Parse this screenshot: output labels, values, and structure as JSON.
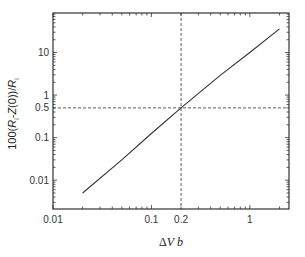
{
  "chart_data": {
    "type": "line",
    "title": "",
    "xlabel": "ΔV b",
    "ylabel": "100(R_i - Z(0))/R_i",
    "xscale": "log",
    "yscale": "log",
    "xlim": [
      0.01,
      2.5
    ],
    "ylim": [
      0.0021,
      85
    ],
    "grid": false,
    "legend": null,
    "x_ticks": [
      {
        "value": 0.01,
        "label": "0.01"
      },
      {
        "value": 0.1,
        "label": "0.1"
      },
      {
        "value": 0.2,
        "label": "0.2"
      },
      {
        "value": 1,
        "label": "1"
      }
    ],
    "y_ticks": [
      {
        "value": 0.01,
        "label": "0.01"
      },
      {
        "value": 0.1,
        "label": "0.1"
      },
      {
        "value": 0.5,
        "label": "0.5"
      },
      {
        "value": 1,
        "label": "1"
      },
      {
        "value": 10,
        "label": "10"
      }
    ],
    "series": [
      {
        "name": "curve",
        "style": "solid",
        "color": "#333333",
        "x": [
          0.02,
          0.05,
          0.1,
          0.2,
          0.5,
          1.0,
          2.0
        ],
        "y": [
          0.005,
          0.03,
          0.125,
          0.5,
          2.9,
          10,
          36
        ]
      }
    ],
    "annotations": [
      {
        "type": "vline",
        "x": 0.2,
        "style": "dashed"
      },
      {
        "type": "hline",
        "y": 0.5,
        "style": "dashed"
      }
    ]
  },
  "labels": {
    "x_title_delta": "Δ",
    "x_title_V": "V",
    "x_title_b": "b",
    "y_title_prefix": "100(",
    "y_title_R": "R",
    "y_title_sub": "i",
    "y_title_mid": "-",
    "y_title_Z": "Z",
    "y_title_zero": "(0))/",
    "y_title_R2": "R",
    "y_title_sub2": "i"
  }
}
